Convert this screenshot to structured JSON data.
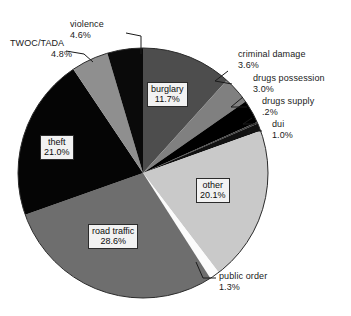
{
  "chart_data": {
    "type": "pie",
    "title": "",
    "legend_position": "none",
    "grid": false,
    "labels_show_percent": true,
    "categories": [
      "burglary",
      "criminal damage",
      "drugs possession",
      "drugs supply",
      "dui",
      "other",
      "public order",
      "road traffic",
      "theft",
      "TWOC/TADA",
      "violence"
    ],
    "values": [
      11.7,
      3.6,
      3.0,
      0.2,
      1.0,
      20.1,
      1.3,
      28.6,
      21.0,
      4.8,
      4.6
    ],
    "slices": [
      {
        "label": "burglary",
        "percent_text": "11.7%",
        "value": 11.7,
        "color": "#4d4d4d",
        "label_style": "boxed-inside"
      },
      {
        "label": "criminal damage",
        "percent_text": "3.6%",
        "value": 3.6,
        "color": "#808080",
        "label_style": "leader-outside"
      },
      {
        "label": "drugs possession",
        "percent_text": "3.0%",
        "value": 3.0,
        "color": "#000000",
        "label_style": "leader-outside"
      },
      {
        "label": "drugs supply",
        "percent_text": ".2%",
        "value": 0.2,
        "color": "#3d3d3d",
        "label_style": "leader-outside"
      },
      {
        "label": "dui",
        "percent_text": "1.0%",
        "value": 1.0,
        "color": "#111111",
        "label_style": "leader-outside"
      },
      {
        "label": "other",
        "percent_text": "20.1%",
        "value": 20.1,
        "color": "#c9c9c9",
        "label_style": "boxed-inside"
      },
      {
        "label": "public order",
        "percent_text": "1.3%",
        "value": 1.3,
        "color": "#fbfbfb",
        "label_style": "leader-outside"
      },
      {
        "label": "road traffic",
        "percent_text": "28.6%",
        "value": 28.6,
        "color": "#6e6e6e",
        "label_style": "boxed-inside"
      },
      {
        "label": "theft",
        "percent_text": "21.0%",
        "value": 21.0,
        "color": "#050505",
        "label_style": "boxed-inside"
      },
      {
        "label": "TWOC/TADA",
        "percent_text": "4.8%",
        "value": 4.8,
        "color": "#8f8f8f",
        "label_style": "leader-outside"
      },
      {
        "label": "violence",
        "percent_text": "4.6%",
        "value": 4.6,
        "color": "#0a0a0a",
        "label_style": "leader-outside"
      }
    ]
  },
  "labels": {
    "violence": {
      "name": "violence",
      "pct": "4.6%"
    },
    "twoc_tada": {
      "name": "TWOC/TADA",
      "pct": "4.8%"
    },
    "criminal_damage": {
      "name": "criminal damage",
      "pct": "3.6%"
    },
    "drugs_possession": {
      "name": "drugs possession",
      "pct": "3.0%"
    },
    "drugs_supply": {
      "name": "drugs supply",
      "pct": ".2%"
    },
    "dui": {
      "name": "dui",
      "pct": "1.0%"
    },
    "public_order": {
      "name": "public order",
      "pct": "1.3%"
    },
    "burglary": {
      "name": "burglary",
      "pct": "11.7%"
    },
    "theft": {
      "name": "theft",
      "pct": "21.0%"
    },
    "road_traffic": {
      "name": "road traffic",
      "pct": "28.6%"
    },
    "other": {
      "name": "other",
      "pct": "20.1%"
    }
  }
}
